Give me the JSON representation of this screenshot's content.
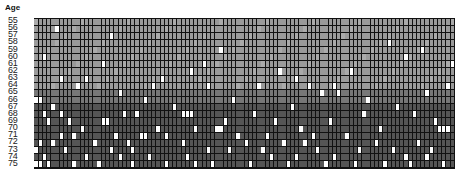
{
  "chart_data": {
    "type": "heatmap",
    "title": "",
    "ylabel": "Age",
    "xlabel": "",
    "columns": 100,
    "rows": [
      55,
      56,
      57,
      58,
      59,
      60,
      61,
      62,
      63,
      64,
      65,
      66,
      67,
      68,
      69,
      70,
      71,
      72,
      73,
      74,
      75
    ],
    "colors": {
      "band_light": "#9a9a9a",
      "band_mid": "#777777",
      "band_dark": "#555555",
      "highlight": "#ffffff",
      "light_accent": "#c8c8c8",
      "grid_line": "#111111"
    },
    "bands": [
      {
        "from": 55,
        "to": 64,
        "color": "band_light"
      },
      {
        "from": 65,
        "to": 66,
        "color": "band_mid"
      },
      {
        "from": 67,
        "to": 75,
        "color": "band_dark"
      }
    ],
    "highlights": {
      "55": [],
      "56": [
        5
      ],
      "57": [
        18
      ],
      "58": [
        84
      ],
      "59": [
        44,
        92
      ],
      "60": [
        2,
        88
      ],
      "61": [
        16,
        40,
        99
      ],
      "62": [
        37,
        58,
        75
      ],
      "63": [
        6,
        12,
        30,
        62
      ],
      "64": [
        10,
        28,
        41,
        53,
        65,
        71,
        98
      ],
      "65": [
        20,
        68,
        72,
        93
      ],
      "66": [
        0,
        1,
        26,
        47,
        79
      ],
      "67": [
        4,
        33,
        61,
        86
      ],
      "68": [
        2,
        6,
        21,
        24,
        35,
        36,
        37,
        52,
        78,
        90
      ],
      "69": [
        3,
        8,
        16,
        17,
        45,
        57,
        70,
        95
      ],
      "70": [
        11,
        29,
        38,
        43,
        44,
        63,
        82,
        96,
        97,
        98
      ],
      "71": [
        6,
        9,
        19,
        25,
        26,
        31,
        48,
        55,
        66,
        74
      ],
      "72": [
        1,
        4,
        14,
        22,
        35,
        50,
        59,
        64,
        81,
        91
      ],
      "73": [
        0,
        7,
        18,
        23,
        41,
        46,
        54,
        67,
        77,
        85,
        94
      ],
      "74": [
        2,
        12,
        20,
        27,
        36,
        56,
        62,
        71,
        88,
        93
      ],
      "75": [
        0,
        1,
        3,
        9,
        15,
        23,
        31,
        38,
        42,
        51,
        60,
        69,
        76,
        83,
        89,
        97
      ]
    }
  }
}
